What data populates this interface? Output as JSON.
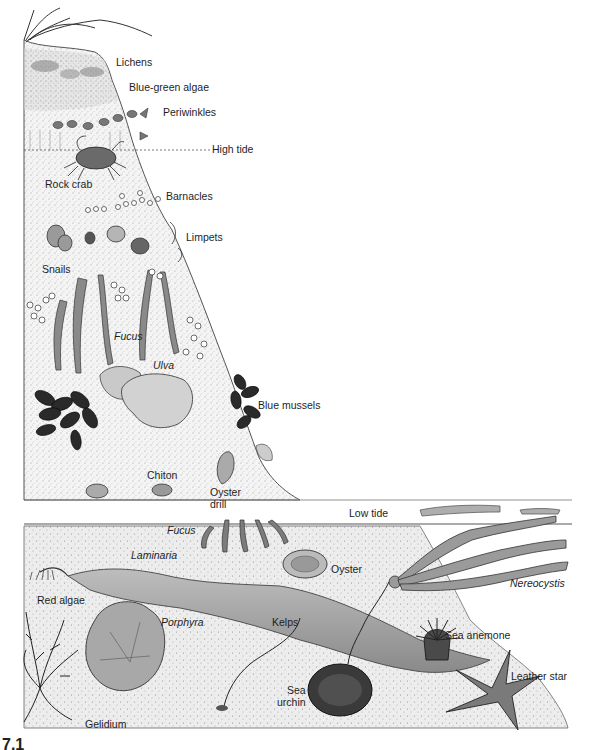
{
  "diagram": {
    "zones": {
      "high_tide": "High tide",
      "low_tide": "Low tide"
    },
    "labels": [
      {
        "id": "lichens",
        "text": "Lichens",
        "italic": false,
        "x": 116,
        "y": 62
      },
      {
        "id": "blue-green-algae",
        "text": "Blue-green algae",
        "italic": false,
        "x": 129,
        "y": 87
      },
      {
        "id": "periwinkles",
        "text": "Periwinkles",
        "italic": false,
        "x": 163,
        "y": 112
      },
      {
        "id": "high-tide",
        "text": "High tide",
        "italic": false,
        "x": 212,
        "y": 144
      },
      {
        "id": "rock-crab",
        "text": "Rock crab",
        "italic": false,
        "x": 45,
        "y": 180
      },
      {
        "id": "barnacles",
        "text": "Barnacles",
        "italic": false,
        "x": 166,
        "y": 190
      },
      {
        "id": "limpets",
        "text": "Limpets",
        "italic": false,
        "x": 186,
        "y": 231
      },
      {
        "id": "snails",
        "text": "Snails",
        "italic": false,
        "x": 42,
        "y": 264
      },
      {
        "id": "fucus-upper",
        "text": "Fucus",
        "italic": true,
        "x": 114,
        "y": 330
      },
      {
        "id": "ulva",
        "text": "Ulva",
        "italic": true,
        "x": 153,
        "y": 360
      },
      {
        "id": "blue-mussels",
        "text": "Blue mussels",
        "italic": false,
        "x": 258,
        "y": 400
      },
      {
        "id": "chiton",
        "text": "Chiton",
        "italic": false,
        "x": 147,
        "y": 469
      },
      {
        "id": "oyster-drill",
        "text": "Oyster\ndrill",
        "italic": false,
        "x": 210,
        "y": 486
      },
      {
        "id": "low-tide",
        "text": "Low tide",
        "italic": false,
        "x": 349,
        "y": 508
      },
      {
        "id": "fucus-lower",
        "text": "Fucus",
        "italic": true,
        "x": 167,
        "y": 523
      },
      {
        "id": "laminaria",
        "text": "Laminaria",
        "italic": true,
        "x": 131,
        "y": 549
      },
      {
        "id": "oyster",
        "text": "Oyster",
        "italic": false,
        "x": 331,
        "y": 563
      },
      {
        "id": "nereocystis",
        "text": "Nereocystis",
        "italic": true,
        "x": 510,
        "y": 577
      },
      {
        "id": "red-algae",
        "text": "Red algae",
        "italic": false,
        "x": 37,
        "y": 594
      },
      {
        "id": "porphyra",
        "text": "Porphyra",
        "italic": true,
        "x": 161,
        "y": 616
      },
      {
        "id": "kelps",
        "text": "Kelps",
        "italic": false,
        "x": 272,
        "y": 616
      },
      {
        "id": "sea-anemone",
        "text": "Sea anemone",
        "italic": false,
        "x": 445,
        "y": 629
      },
      {
        "id": "leather-star",
        "text": "Leather star",
        "italic": false,
        "x": 511,
        "y": 670
      },
      {
        "id": "sea-urchin",
        "text": "Sea\nurchin",
        "italic": false,
        "x": 277,
        "y": 686
      },
      {
        "id": "gelidium",
        "text": "Gelidium",
        "italic": false,
        "x": 85,
        "y": 718
      }
    ],
    "figure_number_partial": "7.1"
  }
}
